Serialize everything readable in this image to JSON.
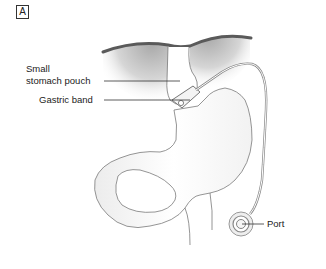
{
  "figure": {
    "panel_label": "A",
    "labels": {
      "small_stomach_pouch_line1": "Small",
      "small_stomach_pouch_line2": "stomach pouch",
      "gastric_band": "Gastric band",
      "port": "Port"
    }
  },
  "colors": {
    "diaphragm_edge": "#555555",
    "diaphragm_shade": "#b8b8b8",
    "outline": "#777777",
    "stomach_shade": "#eeeeee",
    "leader_line": "#333333",
    "text": "#222222"
  }
}
